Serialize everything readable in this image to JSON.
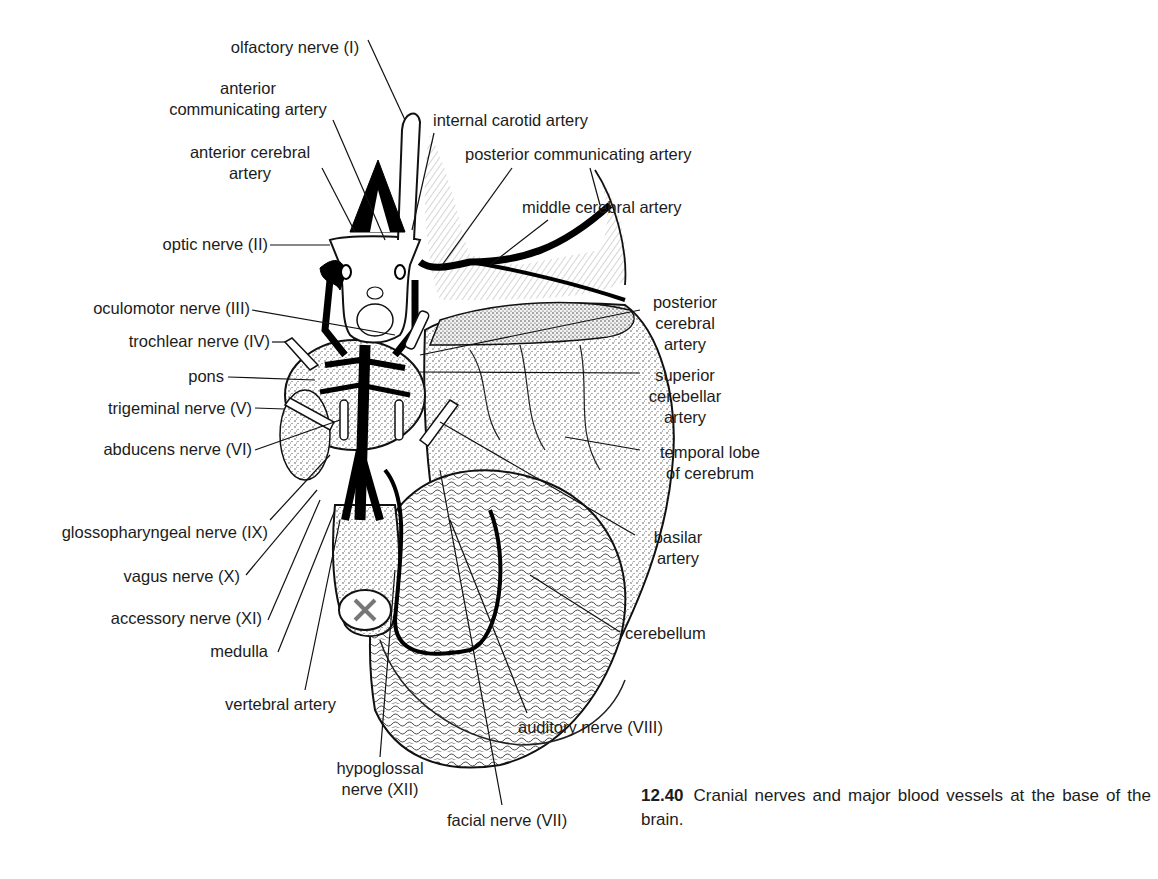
{
  "figure": {
    "number": "12.40",
    "caption": "Cranial nerves and major blood vessels at the base of the brain."
  },
  "labels": {
    "olfactory_nerve": "olfactory nerve (I)",
    "anterior_communicating_artery": [
      "anterior",
      "communicating artery"
    ],
    "internal_carotid_artery": "internal carotid artery",
    "anterior_cerebral_artery": [
      "anterior cerebral",
      "artery"
    ],
    "posterior_communicating_artery": "posterior communicating artery",
    "middle_cerebral_artery": "middle cerebral artery",
    "optic_nerve": "optic nerve (II)",
    "oculomotor_nerve": "oculomotor nerve (III)",
    "posterior_cerebral_artery": [
      "posterior",
      "cerebral",
      "artery"
    ],
    "trochlear_nerve": "trochlear nerve (IV)",
    "pons": "pons",
    "superior_cerebellar_artery": [
      "superior",
      "cerebellar",
      "artery"
    ],
    "trigeminal_nerve": "trigeminal nerve (V)",
    "temporal_lobe": [
      "temporal lobe",
      "of cerebrum"
    ],
    "abducens_nerve": "abducens nerve (VI)",
    "glossopharyngeal_nerve": "glossopharyngeal nerve (IX)",
    "basilar_artery": [
      "basilar",
      "artery"
    ],
    "vagus_nerve": "vagus nerve (X)",
    "accessory_nerve": "accessory nerve (XI)",
    "cerebellum": "cerebellum",
    "medulla": "medulla",
    "vertebral_artery": "vertebral artery",
    "auditory_nerve": "auditory nerve (VIII)",
    "hypoglossal_nerve": [
      "hypoglossal",
      "nerve (XII)"
    ],
    "facial_nerve": "facial nerve (VII)"
  }
}
